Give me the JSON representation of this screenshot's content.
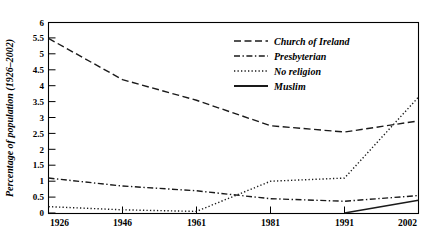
{
  "chart_data": {
    "type": "line",
    "title": "",
    "subtitle": "",
    "xlabel": "",
    "ylabel": "Percentage of population (1926–2002)",
    "x": [
      "1926",
      "1946",
      "1961",
      "1981",
      "1991",
      "2002"
    ],
    "categories": [
      "1926",
      "1946",
      "1961",
      "1981",
      "1991",
      "2002"
    ],
    "xlim": [
      0,
      5
    ],
    "ylim": [
      0,
      6
    ],
    "ytick_step": 0.5,
    "grid": false,
    "legend_position": "upper-right-inside",
    "series": [
      {
        "name": "Church of Ireland",
        "style": "dashed",
        "values": [
          5.5,
          4.2,
          3.55,
          2.75,
          2.55,
          2.9
        ]
      },
      {
        "name": "Presbyterian",
        "style": "dash-dot",
        "values": [
          1.1,
          0.85,
          0.7,
          0.45,
          0.37,
          0.55
        ]
      },
      {
        "name": "No religion",
        "style": "dotted",
        "values": [
          0.2,
          0.1,
          0.05,
          1.0,
          1.1,
          3.65
        ]
      },
      {
        "name": "Muslim",
        "style": "solid",
        "x": [
          "1991",
          "2002"
        ],
        "values": [
          0.0,
          0.4
        ]
      }
    ]
  },
  "axes": {
    "y_ticks": [
      "0",
      "0.5",
      "1",
      "1.5",
      "2",
      "2.5",
      "3",
      "3.5",
      "4",
      "4.5",
      "5",
      "5.5",
      "6"
    ],
    "x_ticks": [
      "1926",
      "1946",
      "1961",
      "1981",
      "1991",
      "2002"
    ],
    "y_title": "Percentage of population (1926–2002)"
  },
  "legend": {
    "entries": [
      {
        "label": "Church of Ireland",
        "style": "dashed"
      },
      {
        "label": "Presbyterian",
        "style": "dash-dot"
      },
      {
        "label": "No religion",
        "style": "dotted"
      },
      {
        "label": "Muslim",
        "style": "solid"
      }
    ]
  },
  "colors": {
    "line": "#1a1a1a",
    "frame": "#000000",
    "background": "#ffffff",
    "text": "#000000"
  }
}
